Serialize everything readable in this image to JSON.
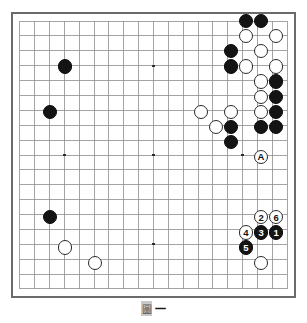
{
  "figure": {
    "kind": "go-board-diagram",
    "board_size": 19,
    "caption_glyph": "圖",
    "caption_number": "一"
  },
  "board": {
    "columns": 19,
    "rows": 19,
    "line_color": "#8c8c8c",
    "edge_color": "#6b6b6b",
    "background_color": "#ffffff",
    "star_points": [
      {
        "col": 3,
        "row": 3
      },
      {
        "col": 9,
        "row": 3
      },
      {
        "col": 15,
        "row": 3
      },
      {
        "col": 3,
        "row": 9
      },
      {
        "col": 9,
        "row": 9
      },
      {
        "col": 15,
        "row": 9
      },
      {
        "col": 3,
        "row": 15
      },
      {
        "col": 9,
        "row": 15
      },
      {
        "col": 15,
        "row": 15
      }
    ]
  },
  "stones": {
    "black_color": "#141414",
    "white_color": "#ffffff",
    "plain": [
      {
        "col": 15,
        "row": 0,
        "color": "black"
      },
      {
        "col": 16,
        "row": 0,
        "color": "black"
      },
      {
        "col": 15,
        "row": 1,
        "color": "white"
      },
      {
        "col": 17,
        "row": 1,
        "color": "white"
      },
      {
        "col": 14,
        "row": 2,
        "color": "black"
      },
      {
        "col": 16,
        "row": 2,
        "color": "white"
      },
      {
        "col": 3,
        "row": 3,
        "color": "black"
      },
      {
        "col": 14,
        "row": 3,
        "color": "black"
      },
      {
        "col": 15,
        "row": 3,
        "color": "white"
      },
      {
        "col": 17,
        "row": 3,
        "color": "white"
      },
      {
        "col": 17,
        "row": 4,
        "color": "black"
      },
      {
        "col": 2,
        "row": 6,
        "color": "black"
      },
      {
        "col": 16,
        "row": 4,
        "color": "white"
      },
      {
        "col": 17,
        "row": 5,
        "color": "black"
      },
      {
        "col": 16,
        "row": 5,
        "color": "white"
      },
      {
        "col": 12,
        "row": 6,
        "color": "white"
      },
      {
        "col": 14,
        "row": 6,
        "color": "white"
      },
      {
        "col": 16,
        "row": 6,
        "color": "white"
      },
      {
        "col": 17,
        "row": 6,
        "color": "black"
      },
      {
        "col": 13,
        "row": 7,
        "color": "white"
      },
      {
        "col": 14,
        "row": 7,
        "color": "black"
      },
      {
        "col": 16,
        "row": 7,
        "color": "black"
      },
      {
        "col": 17,
        "row": 7,
        "color": "black"
      },
      {
        "col": 14,
        "row": 8,
        "color": "black"
      },
      {
        "col": 2,
        "row": 13,
        "color": "black"
      },
      {
        "col": 3,
        "row": 15,
        "color": "white"
      },
      {
        "col": 5,
        "row": 16,
        "color": "white"
      },
      {
        "col": 16,
        "row": 16,
        "color": "white"
      }
    ],
    "marked": [
      {
        "col": 16,
        "row": 9,
        "color": "white",
        "label": "A",
        "name": "stone-marker-a"
      }
    ],
    "numbered": [
      {
        "col": 17,
        "row": 14,
        "color": "black",
        "label": "1",
        "name": "move-1"
      },
      {
        "col": 16,
        "row": 13,
        "color": "white",
        "label": "2",
        "name": "move-2"
      },
      {
        "col": 16,
        "row": 14,
        "color": "black",
        "label": "3",
        "name": "move-3"
      },
      {
        "col": 15,
        "row": 14,
        "color": "white",
        "label": "4",
        "name": "move-4"
      },
      {
        "col": 15,
        "row": 15,
        "color": "black",
        "label": "5",
        "name": "move-5"
      },
      {
        "col": 17,
        "row": 13,
        "color": "white",
        "label": "6",
        "name": "move-6"
      }
    ]
  },
  "chart_data": {
    "type": "table"
  }
}
